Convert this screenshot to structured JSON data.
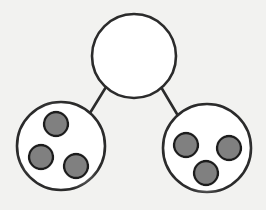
{
  "canvas": {
    "width": 266,
    "height": 210,
    "background_color": "#f2f2f0"
  },
  "style": {
    "node_fill": "#ffffff",
    "node_stroke": "#2b2b2b",
    "node_stroke_width": 2.6,
    "edge_stroke": "#2b2b2b",
    "edge_stroke_width": 2.6,
    "dot_fill": "#808080",
    "dot_stroke": "#1a1a1a",
    "dot_stroke_width": 2.4,
    "dot_glow_color": "#ffffff"
  },
  "chart_data": {
    "type": "diagram",
    "title": "",
    "nodes": [
      {
        "id": "top",
        "label": "",
        "cx": 134,
        "cy": 56,
        "r": 42,
        "fill": "#ffffff",
        "contents_count": 0,
        "dots": []
      },
      {
        "id": "bottom-left",
        "label": "",
        "cx": 61,
        "cy": 146,
        "r": 44,
        "fill": "#ffffff",
        "contents_count": 3,
        "dots": [
          {
            "id": "bl-dot-1",
            "cx": 56,
            "cy": 124,
            "r": 12
          },
          {
            "id": "bl-dot-2",
            "cx": 41,
            "cy": 157,
            "r": 12
          },
          {
            "id": "bl-dot-3",
            "cx": 76,
            "cy": 166,
            "r": 12
          }
        ]
      },
      {
        "id": "bottom-right",
        "label": "",
        "cx": 207,
        "cy": 148,
        "r": 44,
        "fill": "#ffffff",
        "contents_count": 3,
        "dots": [
          {
            "id": "br-dot-1",
            "cx": 186,
            "cy": 145,
            "r": 12
          },
          {
            "id": "br-dot-2",
            "cx": 229,
            "cy": 148,
            "r": 12
          },
          {
            "id": "br-dot-3",
            "cx": 206,
            "cy": 173,
            "r": 12
          }
        ]
      }
    ],
    "edges": [
      {
        "id": "edge-top-left",
        "from": "top",
        "to": "bottom-left",
        "x1": 106,
        "y1": 87,
        "x2": 90,
        "y2": 113
      },
      {
        "id": "edge-top-right",
        "from": "top",
        "to": "bottom-right",
        "x1": 161,
        "y1": 87,
        "x2": 177,
        "y2": 114
      }
    ]
  }
}
